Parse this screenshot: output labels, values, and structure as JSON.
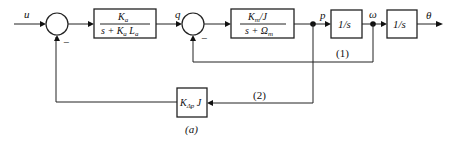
{
  "diagram": {
    "caption": "(a)",
    "signals": {
      "input": "u",
      "q": "q",
      "p": "p",
      "omega": "ω",
      "output": "θ"
    },
    "blocks": {
      "block1": {
        "num": "K",
        "num_sub": "a",
        "den_pre": "s + K",
        "den_sub": "a",
        "den_mid": " L",
        "den_sub2": "a"
      },
      "block2": {
        "num": "K",
        "num_sub": "m",
        "num_post": "/J",
        "den_pre": "s + Ω",
        "den_sub": "m"
      },
      "block3": {
        "label": "1/s"
      },
      "block4": {
        "label": "1/s"
      },
      "feedback_block": {
        "pre": "K",
        "sub": "Δp",
        "post": " J"
      }
    },
    "summing_junctions": [
      {
        "id": "sum1",
        "signs": [
          "+",
          "−"
        ]
      },
      {
        "id": "sum2",
        "signs": [
          "+",
          "−"
        ]
      }
    ],
    "loops": {
      "loop1": "(1)",
      "loop2": "(2)"
    },
    "signs": {
      "minus1": "−",
      "minus2": "−"
    }
  }
}
